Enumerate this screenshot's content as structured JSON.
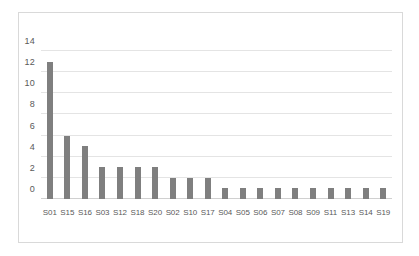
{
  "chart_data": {
    "type": "bar",
    "title": "",
    "subtitle": "",
    "xlabel": "",
    "ylabel": "",
    "categories": [
      "S01",
      "S15",
      "S16",
      "S03",
      "S12",
      "S18",
      "S20",
      "S02",
      "S10",
      "S17",
      "S04",
      "S05",
      "S06",
      "S07",
      "S08",
      "S09",
      "S11",
      "S13",
      "S14",
      "S19"
    ],
    "values": [
      13,
      6,
      5,
      3,
      3,
      3,
      3,
      2,
      2,
      2,
      1,
      1,
      1,
      1,
      1,
      1,
      1,
      1,
      1,
      1
    ],
    "ylim": [
      0,
      14
    ],
    "yticks": [
      0,
      2,
      4,
      6,
      8,
      10,
      12,
      14
    ],
    "ytick_labels": [
      "0",
      "2",
      "4",
      "6",
      "8",
      "10",
      "12",
      "14"
    ],
    "grid": true,
    "grid_axis": "y",
    "legend": false,
    "legend_position": "none",
    "series": [
      {
        "name": "",
        "values": [
          13,
          6,
          5,
          3,
          3,
          3,
          3,
          2,
          2,
          2,
          1,
          1,
          1,
          1,
          1,
          1,
          1,
          1,
          1,
          1
        ]
      }
    ]
  },
  "style": {
    "bar_color": "#7f7f7f",
    "gridline_color": "#e4e4e4",
    "axis_color": "#d0d0d0",
    "tick_label_color": "#595959",
    "plot_background": "#ffffff",
    "figure_border_color": "#d9d9d9"
  }
}
